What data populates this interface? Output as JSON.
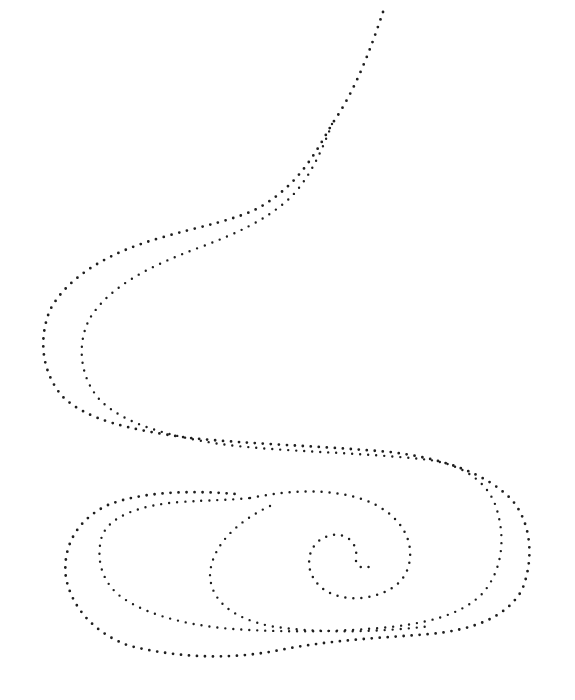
{
  "artwork": {
    "title": "Dotted S-curve with spiral",
    "background": "#ffffff",
    "dot_color": "#1f1f1f",
    "dot_size": 2.6,
    "dot_gap": 8,
    "paths": [
      {
        "name": "outer-strand",
        "d": "M383,12 C372,45 356,90 332,124 C312,160 296,185 262,206 C238,220 200,226 160,238 C110,252 68,276 50,310 C38,340 42,372 62,396 C86,420 130,430 190,438 C250,444 320,446 390,452 C440,458 485,472 512,500 C532,524 534,560 522,590 C506,618 472,630 430,634 C380,638 330,640 280,650 C230,660 180,658 130,646 C95,634 72,608 66,578 C62,548 76,520 108,505 C140,492 190,490 235,494",
        "stroke_width": 2.8
      },
      {
        "name": "inner-strand",
        "d": "M332,124 C322,150 310,178 290,198 C266,220 236,234 198,248 C150,266 110,286 90,318 C76,344 80,378 100,400 C124,424 168,436 220,444 C280,452 360,452 430,460 C468,466 492,486 498,514 C506,544 500,574 482,594 C460,616 424,624 380,628 C330,632 290,632 250,630 C200,628 150,618 120,596 C100,580 96,556 102,536 C110,516 140,505 180,502 C210,500 232,500 250,498",
        "stroke_width": 2.4
      },
      {
        "name": "spiral-outer-arm",
        "d": "M250,498 C290,490 330,488 365,500 C396,512 412,534 410,558 C408,580 392,594 362,598 C336,600 316,590 310,570 C306,552 316,538 332,535 C348,533 358,544 356,558 C355,566 362,570 372,566",
        "stroke_width": 2.5
      },
      {
        "name": "spiral-inner-arm",
        "d": "M270,506 C236,522 212,546 210,574 C210,600 232,618 270,626 C320,634 380,632 432,626",
        "stroke_width": 2.4
      }
    ]
  }
}
